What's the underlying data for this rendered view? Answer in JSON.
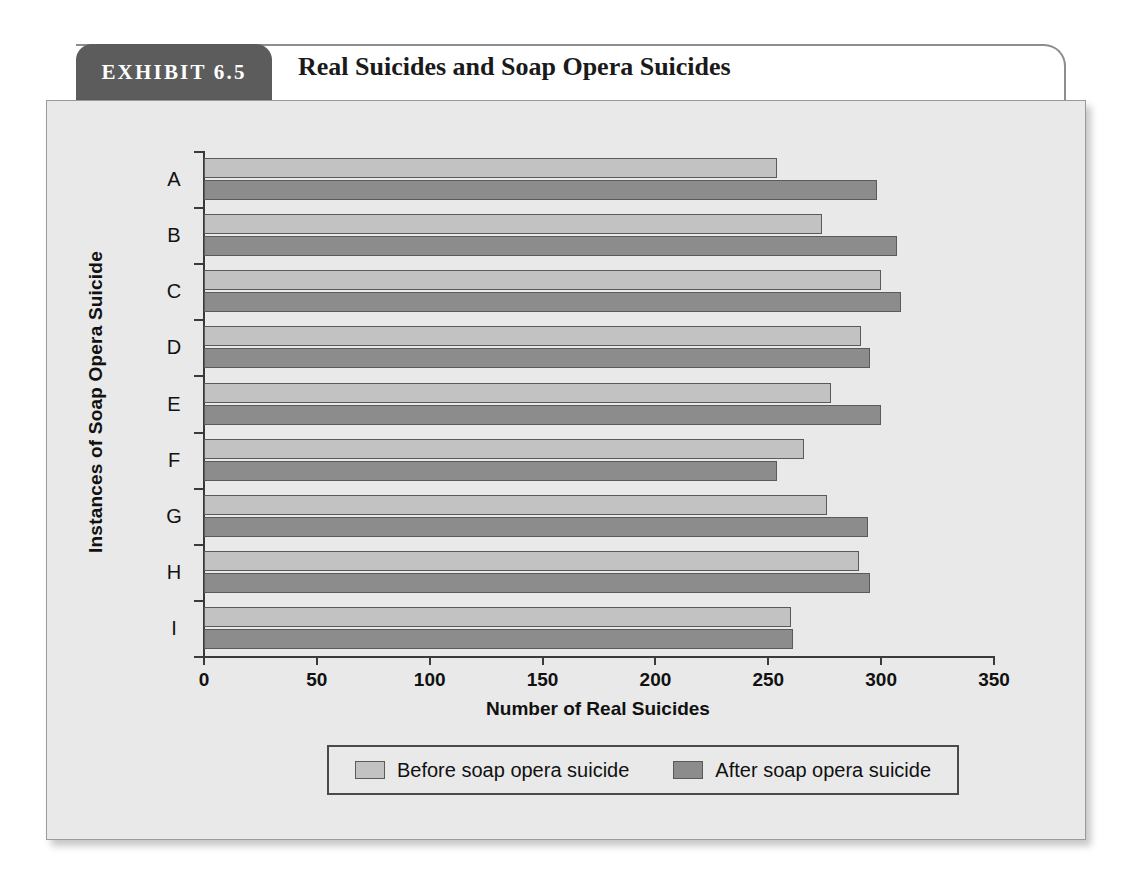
{
  "exhibit": {
    "badge_label": "EXHIBIT 6.5",
    "title": "Real Suicides and Soap Opera Suicides"
  },
  "colors": {
    "before_bar": "#c2c2c2",
    "after_bar": "#8c8c8c",
    "panel_background": "#e9e9e9",
    "badge_background": "#5c5c5c",
    "axis": "#3a3a3a"
  },
  "chart_data": {
    "type": "bar",
    "orientation": "horizontal",
    "title": "Real Suicides and Soap Opera Suicides",
    "xlabel": "Number of Real Suicides",
    "ylabel": "Instances of Soap Opera Suicide",
    "categories": [
      "A",
      "B",
      "C",
      "D",
      "E",
      "F",
      "G",
      "H",
      "I"
    ],
    "series": [
      {
        "name": "Before soap opera suicide",
        "color": "#c2c2c2",
        "values": [
          254,
          274,
          300,
          291,
          278,
          266,
          276,
          290,
          260
        ]
      },
      {
        "name": "After soap opera suicide",
        "color": "#8c8c8c",
        "values": [
          298,
          307,
          309,
          295,
          300,
          254,
          294,
          295,
          261
        ]
      }
    ],
    "xlim": [
      0,
      350
    ],
    "xticks": [
      0,
      50,
      100,
      150,
      200,
      250,
      300,
      350
    ],
    "xtick_labels": [
      "0",
      "50",
      "100",
      "150",
      "200",
      "250",
      "300",
      "350"
    ],
    "grid": false,
    "legend_position": "bottom"
  },
  "legend": {
    "items": [
      {
        "label": "Before soap opera suicide"
      },
      {
        "label": "After soap opera suicide"
      }
    ]
  }
}
